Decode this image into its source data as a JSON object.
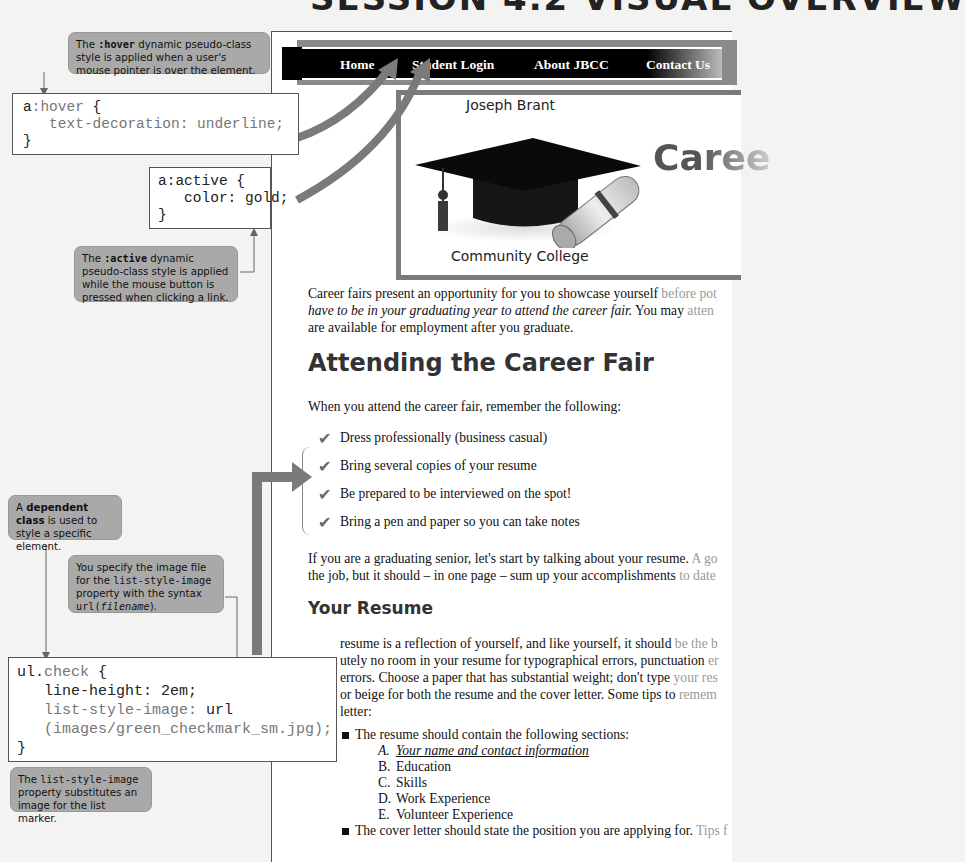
{
  "page_title": "SESSION 4.2 VISUAL OVERVIEW",
  "callouts": {
    "hover": {
      "prefix": "The ",
      "code": ":hover",
      "text": " dynamic pseudo-class style is applied when a user's mouse pointer is over the element."
    },
    "active": {
      "prefix": "The ",
      "code": ":active",
      "text": " dynamic pseudo-class style is applied while the mouse button is pressed when clicking a link."
    },
    "dependent": {
      "prefix": "A ",
      "bold": "dependent class",
      "text": " is used to style a specific element."
    },
    "url": {
      "line1": "You specify the image file for the ",
      "code1": "list-style-image",
      "line2": " property with the syntax ",
      "code2": "url(",
      "code2_italic": "filename",
      "code2_end": ")."
    },
    "list_image": {
      "prefix": "The ",
      "code": "list-style-image",
      "text": " property substitutes an image for the list marker."
    }
  },
  "code_blocks": {
    "hover": {
      "selector_a": "a",
      "selector_b": ":hover",
      "open": " {",
      "prop": "   text-decoration: underline;",
      "close": "}"
    },
    "active": {
      "selector": "a:active {",
      "prop": "   color: gold;",
      "close": "}"
    },
    "check": {
      "selector_a": "ul.",
      "selector_b": "check",
      "open": " {",
      "line1": "   line-height: 2em;",
      "line2_prop": "list-style-image:",
      "line2_val": " url",
      "line3": "   (images/green_checkmark_sm.jpg);",
      "close": "}"
    }
  },
  "browser": {
    "nav": [
      "Home",
      "Student Login",
      "About JBCC",
      "Contact Us"
    ],
    "banner": {
      "top": "Joseph Brant",
      "bottom": "Community College",
      "title": "Caree"
    },
    "intro": {
      "line1_a": "Career fairs present an opportunity for you to showcase yourself ",
      "line1_b": "before pot",
      "line2_italic": "have to be in your graduating year to attend the career fair.",
      "line2_a": " You may ",
      "line2_b": "atten",
      "line3": "are available for employment after you graduate."
    },
    "heading_attending": "Attending the Career Fair",
    "remember": "When you attend the career fair, remember the following:",
    "checklist": [
      "Dress professionally (business casual)",
      "Bring several copies of your resume",
      "Be prepared to be interviewed on the spot!",
      "Bring a pen and paper so you can take notes"
    ],
    "senior": {
      "line1_a": "If you are a graduating senior, let's start by talking about your resume.",
      "line1_b": " A go",
      "line2_a": "the job, but it should – in one page – sum up your accomplishments",
      "line2_b": " to date"
    },
    "heading_resume": "Your Resume",
    "resume_para": [
      {
        "a": "resume is a reflection of yourself, and like yourself, it should ",
        "b": "be the b"
      },
      {
        "a": "utely no room in your resume for typographical errors, punctuation ",
        "b": "er"
      },
      {
        "a": "errors. Choose a paper that has substantial weight; don't type ",
        "b": "your res"
      },
      {
        "a": " or beige for both the resume and the cover letter. Some tips to ",
        "b": "remem"
      },
      {
        "a": " letter:",
        "b": ""
      }
    ],
    "bullets": [
      {
        "text": "The resume should contain the following sections:",
        "sub": [
          {
            "letter": "A.",
            "text": "Your name and contact information",
            "emph": true
          },
          {
            "letter": "B.",
            "text": "Education"
          },
          {
            "letter": "C.",
            "text": "Skills"
          },
          {
            "letter": "D.",
            "text": "Work Experience"
          },
          {
            "letter": "E.",
            "text": "Volunteer Experience"
          }
        ]
      },
      {
        "text": "The cover letter should state the position you are applying for.",
        "fade": " Tips f"
      }
    ]
  },
  "icons": {
    "check": "✔"
  }
}
